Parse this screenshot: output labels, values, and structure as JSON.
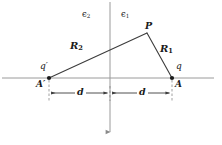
{
  "figure": {
    "type": "physics-diagram",
    "background_color": "#ffffff",
    "line_color": "#3c3c3c",
    "axis_color": "#9a9a9a",
    "text_color": "#1a1a1a"
  },
  "labels": {
    "epsilon_left": "ϵ",
    "epsilon_left_sub": "2",
    "epsilon_right": "ϵ",
    "epsilon_right_sub": "1",
    "point_p": "P",
    "r_right": "R",
    "r_right_sub": "1",
    "r_left": "R",
    "r_left_sub": "2",
    "charge_right": "q",
    "charge_left": "q′",
    "node_right": "A",
    "node_left": "A′",
    "distance_left": "d",
    "distance_right": "d"
  },
  "geometry": {
    "interface_x": 110,
    "baseline_y": 78,
    "node_left_x": 49,
    "node_right_x": 172,
    "apex_x": 147,
    "apex_y": 33,
    "dimension_y": 93,
    "axis_top_y": 2,
    "axis_bottom_y": 132,
    "axis_left_x": 2,
    "axis_right_x": 214
  }
}
